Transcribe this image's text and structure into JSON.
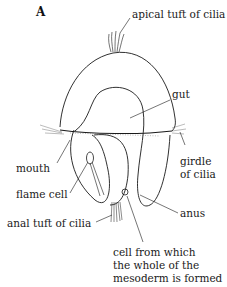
{
  "figure": {
    "panel_label": "A",
    "labels": {
      "apical_tuft": "apical tuft of cilia",
      "gut": "gut",
      "girdle_line1": "girdle",
      "girdle_line2": "of cilia",
      "mouth": "mouth",
      "flame_cell": "flame cell",
      "anus": "anus",
      "anal_tuft": "anal tuft of cilia",
      "mesoderm_line1": "cell from which",
      "mesoderm_line2": "the whole of the",
      "mesoderm_line3": "mesoderm is formed"
    },
    "colors": {
      "ink": "#1a1a1a",
      "background": "#ffffff"
    }
  }
}
